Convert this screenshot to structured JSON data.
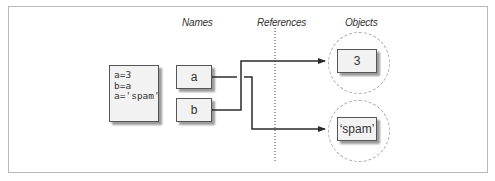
{
  "headers": {
    "names": "Names",
    "references": "References",
    "objects": "Objects"
  },
  "code_block": {
    "lines": [
      "a=3",
      "b=a",
      "a='spam'"
    ],
    "text": "a=3\nb=a\na='spam'"
  },
  "names": [
    {
      "label": "a"
    },
    {
      "label": "b"
    }
  ],
  "objects": [
    {
      "label": "3"
    },
    {
      "label": "‘spam’"
    }
  ],
  "references": [
    {
      "from": "a",
      "to": "'spam'"
    },
    {
      "from": "b",
      "to": "3"
    }
  ],
  "colors": {
    "line": "#2b2b2b",
    "box_fill": "#f2f2f2",
    "dashed_circle": "#aaaaaa",
    "frame": "#b8b8b8"
  }
}
